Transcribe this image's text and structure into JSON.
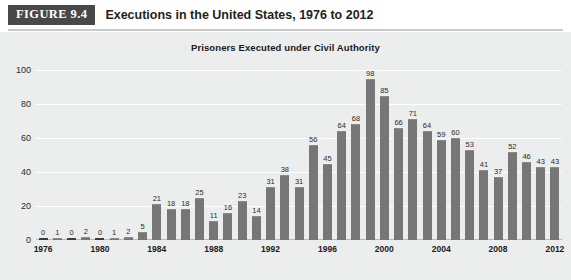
{
  "figure": {
    "badge": "FIGURE 9.4",
    "caption": "Executions in the United States, 1976 to 2012"
  },
  "colors": {
    "badge_bg": "#484848",
    "bar": "#767676",
    "panel_bg": "#eceded",
    "gridline": "#ffffff",
    "text": "#1a1a1a"
  },
  "chart_data": {
    "type": "bar",
    "title": "Prisoners Executed under Civil Authority",
    "xlabel": "",
    "ylabel": "",
    "ylim": [
      0,
      100
    ],
    "yticks": [
      0,
      20,
      40,
      60,
      80,
      100
    ],
    "grid": true,
    "legend": "none",
    "data_labels": true,
    "categories": [
      "1976",
      "1977",
      "1978",
      "1979",
      "1980",
      "1981",
      "1982",
      "1983",
      "1984",
      "1985",
      "1986",
      "1987",
      "1988",
      "1989",
      "1990",
      "1991",
      "1992",
      "1993",
      "1994",
      "1995",
      "1996",
      "1997",
      "1998",
      "1999",
      "2000",
      "2001",
      "2002",
      "2003",
      "2004",
      "2005",
      "2006",
      "2007",
      "2008",
      "2009",
      "2010",
      "2011",
      "2012"
    ],
    "values": [
      0,
      1,
      0,
      2,
      0,
      1,
      2,
      5,
      21,
      18,
      18,
      25,
      11,
      16,
      23,
      14,
      31,
      38,
      31,
      56,
      45,
      64,
      68,
      98,
      85,
      66,
      71,
      64,
      59,
      60,
      53,
      41,
      37,
      52,
      46,
      43,
      43
    ],
    "xtick_labels": [
      "1976",
      "1980",
      "1984",
      "1988",
      "1992",
      "1996",
      "2000",
      "2004",
      "2008",
      "2012"
    ],
    "xtick_indices": [
      0,
      4,
      8,
      12,
      16,
      20,
      24,
      28,
      32,
      36
    ]
  }
}
